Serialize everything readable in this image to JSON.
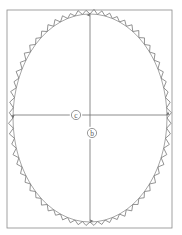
{
  "figure": {
    "type": "technical-diagram",
    "background_color": "#ffffff",
    "canvas": {
      "width": 182,
      "height": 235
    },
    "frame": {
      "name": "bounding-rectangle",
      "x": 7,
      "y": 10,
      "width": 165,
      "height": 218,
      "stroke_color": "#8a8a8a",
      "stroke_width": 0.8
    },
    "ellipse": {
      "name": "smooth-ellipse",
      "cx": 90,
      "cy": 118,
      "rx": 77,
      "ry": 104,
      "stroke_color": "#8f8f8f",
      "stroke_width": 0.8
    },
    "sawtooth": {
      "name": "serrated-ellipse-outline",
      "cx": 90,
      "cy": 118,
      "rx": 77,
      "ry": 104,
      "teeth": 64,
      "amplitude": 4.2,
      "stroke_color": "#777777",
      "stroke_width": 0.8
    },
    "dimensions": [
      {
        "id": "c",
        "label": "c",
        "orientation": "horizontal",
        "axis_y": 115,
        "x_start": 13,
        "x_end": 168,
        "label_x": 76,
        "label_y": 115,
        "arrow_start": true,
        "arrow_end": true,
        "stroke_color": "#6e6e6e"
      },
      {
        "id": "b",
        "label": "b",
        "orientation": "vertical",
        "axis_x": 90,
        "y_start": 15,
        "y_end": 221,
        "label_x": 92,
        "label_y": 133,
        "arrow_start": true,
        "arrow_end": true,
        "stroke_color": "#6e6e6e"
      }
    ],
    "colors": {
      "line": "#8a8a8a",
      "sawtooth": "#777777",
      "dimension": "#6e6e6e",
      "label": "#5a5a5a",
      "background": "#ffffff"
    }
  }
}
